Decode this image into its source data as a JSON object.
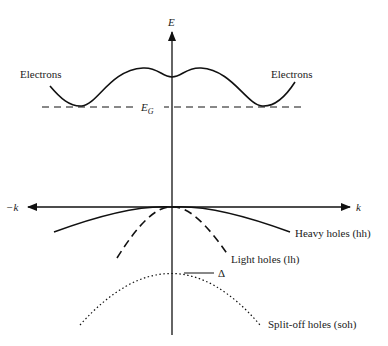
{
  "diagram": {
    "axes": {
      "y_label": "E",
      "x_label_positive": "k",
      "x_label_negative": "−k"
    },
    "band_gap_label": "E",
    "band_gap_subscript": "G",
    "labels": {
      "electrons_left": "Electrons",
      "electrons_right": "Electrons",
      "heavy_holes": "Heavy holes (hh)",
      "light_holes": "Light holes (lh)",
      "split_off_holes": "Split-off holes (soh)",
      "split_off_energy": "Δ"
    },
    "colors": {
      "line": "#111111",
      "text": "#222222",
      "background": "#ffffff"
    }
  }
}
